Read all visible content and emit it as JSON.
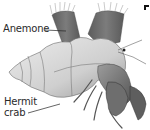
{
  "figure": {
    "labels": {
      "anemone": "Anemone",
      "hermit_crab_line1": "Hermit",
      "hermit_crab_line2": "crab"
    }
  },
  "colors": {
    "background": "#ffffff",
    "label_text": "#2a2a2a",
    "leader_line": "#222222",
    "shell_light": "#e6e6e6",
    "shell_mid": "#bdbdbd",
    "shell_dark": "#7a7a7a",
    "anemone_body": "#6e6e6e",
    "anemone_tentacles": "#9a9a9a",
    "crab_body": "#8a8a8a",
    "crab_dark": "#5a5a5a"
  }
}
